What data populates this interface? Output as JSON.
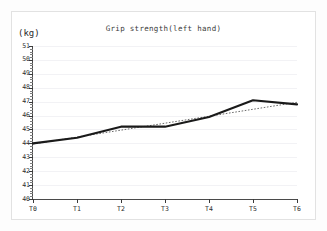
{
  "chart_data": {
    "type": "line",
    "title": "Grip strength(left hand)",
    "xlabel": "",
    "ylabel": "(kg)",
    "unit": "kg",
    "categories": [
      "T0",
      "T1",
      "T2",
      "T3",
      "T4",
      "T5",
      "T6"
    ],
    "ylim": [
      40,
      51
    ],
    "y_ticks": [
      40,
      41,
      42,
      43,
      44,
      45,
      46,
      47,
      48,
      49,
      50,
      51
    ],
    "y_minor_tick_step": 0.2,
    "grid": true,
    "legend": "none",
    "series": [
      {
        "name": "Grip strength (left hand)",
        "style": "solid",
        "color": "#1a1a1a",
        "values": [
          44.0,
          44.4,
          45.2,
          45.2,
          45.9,
          47.1,
          46.8
        ]
      },
      {
        "name": "Linear trend",
        "style": "dotted",
        "color": "#6b6b6b",
        "values": [
          43.95,
          44.45,
          44.95,
          45.45,
          45.95,
          46.45,
          46.95
        ]
      }
    ],
    "annotations": []
  },
  "axes": {
    "y_unit_label": "(kg)",
    "y_tick_labels": [
      "51",
      "50",
      "49",
      "48",
      "47",
      "46",
      "45",
      "44",
      "43",
      "42",
      "41",
      "40"
    ],
    "x_tick_labels": [
      "T0",
      "T1",
      "T2",
      "T3",
      "T4",
      "T5",
      "T6"
    ]
  }
}
